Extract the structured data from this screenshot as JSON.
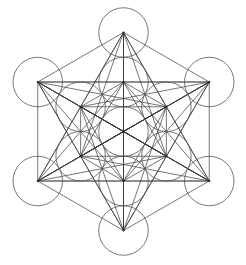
{
  "diagram": {
    "center": [
      123.5,
      131.5
    ],
    "outer_radius": 99,
    "inner_radius": 49.5,
    "circle_radius": 24.75,
    "colors": {
      "background": "#ffffff",
      "line": "#3a3a3a",
      "circle": "#555555",
      "node": "#222222"
    },
    "node_count": 13,
    "connect_all_nodes": true
  }
}
